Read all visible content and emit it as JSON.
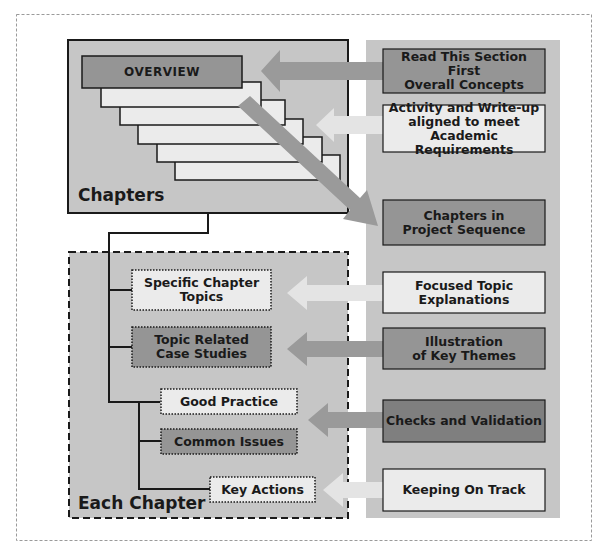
{
  "chapters_group": {
    "title": "Chapters",
    "overview_label": "OVERVIEW",
    "stacked_pages": 5
  },
  "each_chapter_group": {
    "title": "Each Chapter",
    "items": [
      {
        "label": "Specific Chapter\nTopics",
        "style": "light-dotted"
      },
      {
        "label": "Topic Related\nCase Studies",
        "style": "dark-dotted"
      },
      {
        "label": "Good Practice",
        "style": "light-dotted"
      },
      {
        "label": "Common Issues",
        "style": "dark-dotted"
      },
      {
        "label": "Key Actions",
        "style": "light-dotted"
      }
    ]
  },
  "right_panel": {
    "boxes": [
      {
        "label": "Read This Section First\nOverall Concepts",
        "style": "dark",
        "points_to": "OVERVIEW"
      },
      {
        "label": "Activity and Write-up\naligned to meet\nAcademic Requirements",
        "style": "light",
        "points_to": "Chapters"
      },
      {
        "label": "Chapters in\nProject Sequence",
        "style": "dark",
        "points_from": "Chapters"
      },
      {
        "label": "Focused Topic\nExplanations",
        "style": "light",
        "points_to": "Specific Chapter Topics"
      },
      {
        "label": "Illustration\nof Key Themes",
        "style": "dark",
        "points_to": "Topic Related Case Studies"
      },
      {
        "label": "Checks and Validation",
        "style": "dark",
        "points_to": "Good Practice / Common Issues"
      },
      {
        "label": "Keeping On Track",
        "style": "light",
        "points_to": "Key Actions"
      }
    ]
  },
  "colors": {
    "group_fill": "#c6c6c6",
    "dark_box": "#959595",
    "light_box": "#ececec",
    "dark_arrow": "#9a9a9a",
    "light_arrow": "#e4e4e4",
    "outline": "#1a1a1a",
    "outer_border": "#9a9a9a"
  }
}
